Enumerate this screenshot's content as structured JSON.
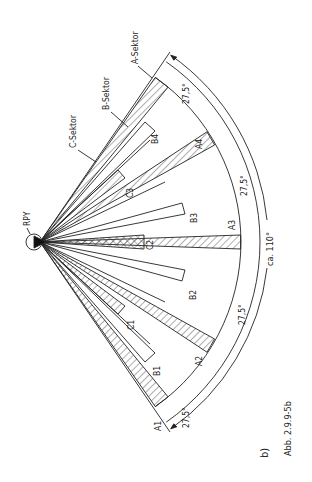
{
  "figure": {
    "caption_label": "b)",
    "caption_ref": "Abb. 2.9.9-5b",
    "origin_label": "RPY",
    "total_angle_label": "ca. 110°",
    "sub_angle_labels": [
      "27,5°",
      "27,5°",
      "27,5°",
      "27,5°"
    ],
    "sector_callouts": {
      "a": "A-Sektor",
      "b": "B-Sektor",
      "c": "C-Sektor"
    },
    "a_sectors": [
      "A1",
      "A2",
      "A3",
      "A4"
    ],
    "b_sectors": [
      "B1",
      "B2",
      "B3",
      "B4"
    ],
    "c_sectors": [
      "C1",
      "C2",
      "C3"
    ],
    "colors": {
      "line": "#222222",
      "background": "#ffffff"
    }
  }
}
